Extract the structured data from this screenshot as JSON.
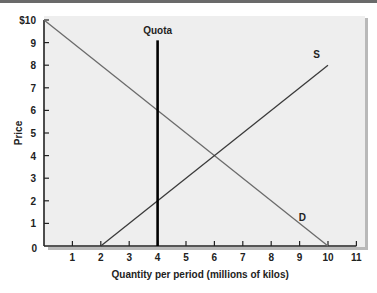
{
  "chart_data": {
    "type": "line",
    "title": "",
    "xlabel": "Quantity per period (millions of kilos)",
    "ylabel": "Price",
    "xlim": [
      0,
      11
    ],
    "ylim": [
      0,
      10
    ],
    "x_ticks": [
      "1",
      "2",
      "3",
      "4",
      "5",
      "6",
      "7",
      "8",
      "9",
      "10",
      "11"
    ],
    "y_ticks": [
      "0",
      "1",
      "2",
      "3",
      "4",
      "5",
      "6",
      "7",
      "8",
      "9",
      "$10"
    ],
    "grid": false,
    "series": [
      {
        "name": "D",
        "label": "D",
        "points": [
          [
            0,
            10
          ],
          [
            10,
            0
          ]
        ],
        "color": "#6b6b6b"
      },
      {
        "name": "S",
        "label": "S",
        "points": [
          [
            2,
            0
          ],
          [
            10,
            8
          ]
        ],
        "color": "#3a3a3a"
      },
      {
        "name": "Quota",
        "label": "Quota",
        "type": "vertical",
        "x": 4,
        "y_range": [
          0,
          9.1
        ],
        "color": "#000000"
      }
    ],
    "annotations": [
      {
        "text": "Quota",
        "x": 4,
        "y": 9.4
      },
      {
        "text": "S",
        "x": 9.6,
        "y": 8.3
      },
      {
        "text": "D",
        "x": 9.1,
        "y": 1.1
      }
    ]
  }
}
